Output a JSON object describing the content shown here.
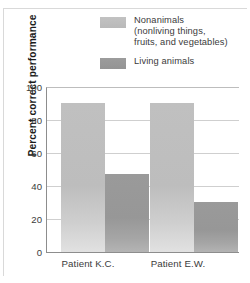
{
  "chart_data": {
    "type": "bar",
    "title": "",
    "xlabel": "",
    "ylabel": "Percent correct performance",
    "ylim": [
      0,
      100
    ],
    "yticks": [
      "0",
      "20",
      "40",
      "60",
      "80",
      "100"
    ],
    "grid": true,
    "legend_position": "top-right",
    "categories": [
      "Patient K.C.",
      "Patient E.W."
    ],
    "series": [
      {
        "name": "Nonanimals (nonliving things, fruits, and vegetables)",
        "legend_lines": [
          "Nonanimals",
          "(nonliving things,",
          "fruits, and vegetables)"
        ],
        "color": "#bdbdbd",
        "values": [
          91,
          91
        ]
      },
      {
        "name": "Living animals",
        "legend_lines": [
          "Living animals"
        ],
        "color": "#979797",
        "values": [
          48,
          31
        ]
      }
    ]
  },
  "colors": {
    "series_light": "#bdbdbd",
    "series_dark": "#979797",
    "axis": "#8d8d8d",
    "gridline": "#cfcfcf",
    "text": "#3b3b3b",
    "background": "#ffffff"
  }
}
